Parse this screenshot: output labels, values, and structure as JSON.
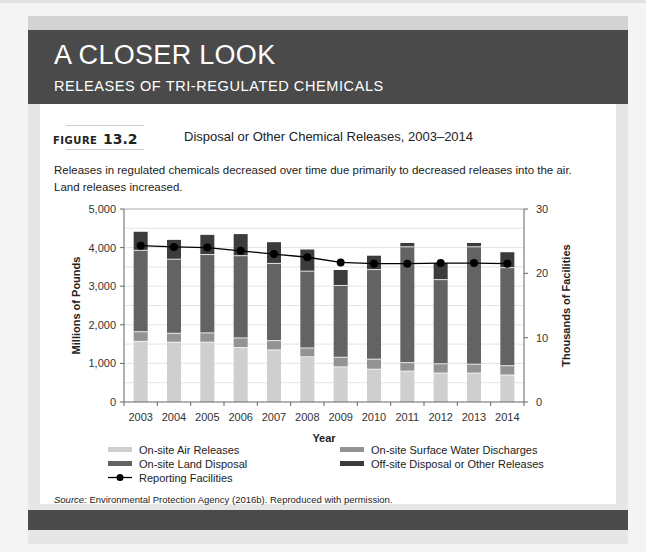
{
  "header": {
    "title": "A CLOSER LOOK",
    "subtitle": "RELEASES OF TRI-REGULATED CHEMICALS"
  },
  "figure": {
    "label_word": "FIGURE",
    "label_number": "13.2",
    "title": "Disposal or Other Chemical Releases, 2003–2014",
    "caption": "Releases in regulated chemicals decreased over time due primarily to decreased releases into the air. Land releases increased."
  },
  "source": {
    "prefix": "Source:",
    "text": " Environmental Protection Agency (2016b). Reproduced with permission."
  },
  "colors": {
    "header_bg": "#4a4a4a",
    "air": "#cfcfcf",
    "water": "#939393",
    "land": "#636363",
    "offsite": "#3c3c3c",
    "facilities_line": "#000000"
  },
  "chart_data": {
    "type": "bar",
    "stacked": true,
    "title": "Disposal or Other Chemical Releases, 2003–2014",
    "xlabel": "Year",
    "ylabel": "Millions of Pounds",
    "y2label": "Thousands of Facilities",
    "ylim": [
      0,
      5000
    ],
    "y2lim": [
      0,
      30
    ],
    "yticks": [
      "0",
      "1,000",
      "2,000",
      "3,000",
      "4,000",
      "5,000"
    ],
    "y2ticks": [
      "0",
      "10",
      "20",
      "30"
    ],
    "grid": true,
    "legend_position": "bottom",
    "categories": [
      "2003",
      "2004",
      "2005",
      "2006",
      "2007",
      "2008",
      "2009",
      "2010",
      "2011",
      "2012",
      "2013",
      "2014"
    ],
    "series": [
      {
        "name": "On-site Air Releases",
        "type": "bar",
        "axis": "left",
        "values": [
          1570,
          1550,
          1550,
          1410,
          1350,
          1170,
          910,
          850,
          800,
          750,
          750,
          700
        ]
      },
      {
        "name": "On-site Surface Water Discharges",
        "type": "bar",
        "axis": "left",
        "values": [
          250,
          230,
          240,
          250,
          240,
          230,
          250,
          260,
          220,
          240,
          230,
          240
        ]
      },
      {
        "name": "On-site Land Disposal",
        "type": "bar",
        "axis": "left",
        "values": [
          2110,
          1920,
          2030,
          2130,
          2000,
          1990,
          1860,
          2320,
          3000,
          2180,
          3040,
          2540
        ]
      },
      {
        "name": "Off-site Disposal or Other Releases",
        "type": "bar",
        "axis": "left",
        "values": [
          480,
          500,
          510,
          560,
          550,
          560,
          400,
          360,
          100,
          430,
          100,
          400
        ]
      },
      {
        "name": "Reporting Facilities",
        "type": "line",
        "axis": "right",
        "values": [
          24.3,
          24.1,
          24.0,
          23.5,
          23.0,
          22.5,
          21.7,
          21.5,
          21.5,
          21.6,
          21.6,
          21.5
        ]
      }
    ]
  },
  "legend": [
    {
      "label": "On-site Air Releases",
      "kind": "bar",
      "color": "#cfcfcf"
    },
    {
      "label": "On-site Surface Water Discharges",
      "kind": "bar",
      "color": "#939393"
    },
    {
      "label": "On-site Land Disposal",
      "kind": "bar",
      "color": "#636363"
    },
    {
      "label": "Off-site Disposal or Other Releases",
      "kind": "bar",
      "color": "#3c3c3c"
    },
    {
      "label": "Reporting Facilities",
      "kind": "line",
      "color": "#000000"
    }
  ]
}
